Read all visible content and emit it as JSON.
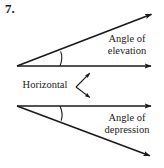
{
  "problem": {
    "number": "7."
  },
  "labels": {
    "elevation_line1": "Angle of",
    "elevation_line2": "elevation",
    "depression_line1": "Angle of",
    "depression_line2": "depression",
    "horizontal": "Horizontal"
  },
  "colors": {
    "stroke": "#1a1a1a",
    "background": "#ffffff",
    "text": "#1a1a1a"
  },
  "diagram": {
    "type": "geometry-figure",
    "upper_group": {
      "vertex": [
        17,
        66
      ],
      "horizontal_ray_end": [
        157,
        66
      ],
      "inclined_ray_end": [
        158,
        12
      ],
      "arc_label": "angle-of-elevation-arc"
    },
    "lower_group": {
      "vertex": [
        17,
        106
      ],
      "horizontal_ray_end": [
        157,
        106
      ],
      "declined_ray_end": [
        156,
        158
      ],
      "arc_label": "angle-of-depression-arc"
    },
    "pointer_upper": {
      "from": [
        76,
        87
      ],
      "to": [
        93,
        70
      ]
    },
    "pointer_lower": {
      "from": [
        76,
        87
      ],
      "to": [
        93,
        100
      ]
    }
  }
}
